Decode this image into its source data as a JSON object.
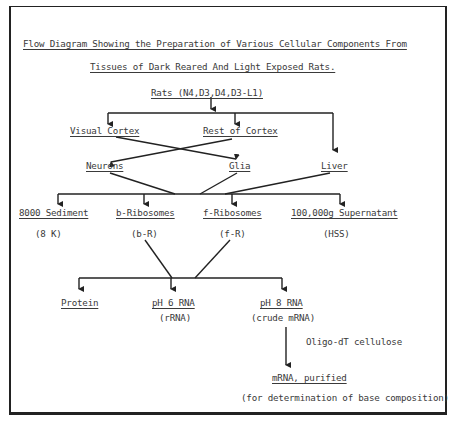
{
  "title": {
    "line1": "Flow Diagram Showing the Preparation of Various Cellular Components From",
    "line2": "Tissues of Dark Reared And Light Exposed Rats."
  },
  "nodes": {
    "rats": "Rats (N4,D3,D4,D3-L1)",
    "visual_cortex": "Visual Cortex",
    "rest_of_cortex": "Rest of Cortex",
    "neurons": "Neurons",
    "glia": "Glia",
    "liver": "Liver",
    "sediment_8000": "8000 Sediment",
    "sediment_8000_abbr": "(8 K)",
    "b_ribosomes": "b-Ribosomes",
    "b_ribosomes_abbr": "(b-R)",
    "f_ribosomes": "f-Ribosomes",
    "f_ribosomes_abbr": "(f-R)",
    "supernatant": "100,000g Supernatant",
    "supernatant_abbr": "(HSS)",
    "protein": "Protein",
    "ph6_rna": "pH 6 RNA",
    "ph6_rna_abbr": "(rRNA)",
    "ph8_rna": "pH 8 RNA",
    "ph8_rna_abbr": "(crude mRNA)",
    "oligo_step": "Oligo-dT cellulose",
    "mrna_purified": "mRNA, purified",
    "purpose": "(for determination of base composition)"
  },
  "colors": {
    "line": "#222222",
    "text": "#3a3a3a",
    "background": "#ffffff"
  }
}
